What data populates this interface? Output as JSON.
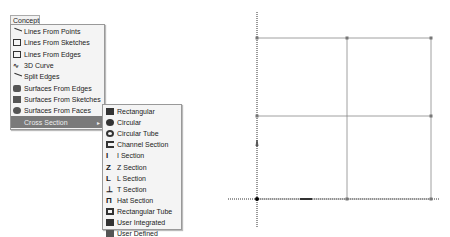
{
  "menubar": {
    "concept_label": "Concept"
  },
  "concept_menu": {
    "items": [
      {
        "label": "Lines From Points",
        "icon": "line-icon"
      },
      {
        "label": "Lines From Sketches",
        "icon": "sketch-lines-icon"
      },
      {
        "label": "Lines From Edges",
        "icon": "edge-lines-icon"
      },
      {
        "label": "3D Curve",
        "icon": "curve-icon"
      },
      {
        "label": "Split Edges",
        "icon": "split-icon"
      },
      {
        "label": "Surfaces From Edges",
        "icon": "surface-edges-icon"
      },
      {
        "label": "Surfaces From Sketches",
        "icon": "surface-sketch-icon"
      },
      {
        "label": "Surfaces From Faces",
        "icon": "surface-faces-icon"
      },
      {
        "label": "Cross Section",
        "icon": "none",
        "submenu_arrow": "▸"
      }
    ]
  },
  "cross_section_menu": {
    "items": [
      {
        "label": "Rectangular"
      },
      {
        "label": "Circular"
      },
      {
        "label": "Circular Tube"
      },
      {
        "label": "Channel Section"
      },
      {
        "label": "I Section"
      },
      {
        "label": "Z Section"
      },
      {
        "label": "L Section"
      },
      {
        "label": "T Section"
      },
      {
        "label": "Hat Section"
      },
      {
        "label": "Rectangular Tube"
      },
      {
        "label": "User Integrated"
      },
      {
        "label": "User Defined"
      }
    ]
  },
  "sketch": {
    "origin": [
      257,
      199
    ],
    "grid_x": [
      257,
      347,
      431
    ],
    "grid_y": [
      38,
      116,
      199
    ],
    "line_color": "#888888",
    "axis_color": "#333333"
  }
}
